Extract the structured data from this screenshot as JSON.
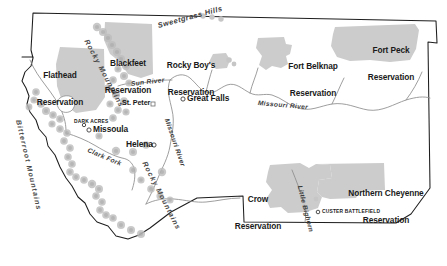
{
  "map": {
    "title": "Montana Indian Reservations and Physical Features",
    "region": "Montana",
    "background_color": "#ffffff",
    "reservation_fill": "#cccccc",
    "outline_color": "#1d1d1d",
    "river_color": "#8d8d8d",
    "mountain_symbol_color": "#bdbdbd"
  },
  "reservations": [
    {
      "id": "flathead",
      "name": "Flathead\nReservation",
      "line1": "Flathead",
      "line2": "Reservation",
      "x": 44,
      "y": 56
    },
    {
      "id": "blackfeet",
      "name": "Blackfeet\nReservation",
      "line1": "Blackfeet",
      "line2": "Reservation",
      "x": 122,
      "y": 44
    },
    {
      "id": "rocky-boys",
      "name": "Rocky Boy's\nReservation",
      "line1": "Rocky Boy's",
      "line2": "Reservation",
      "x": 186,
      "y": 46
    },
    {
      "id": "fort-belknap",
      "name": "Fort Belknap\nReservation",
      "line1": "Fort Belknap",
      "line2": "Reservation",
      "x": 272,
      "y": 48
    },
    {
      "id": "fort-peck",
      "name": "Fort Peck\nReservation",
      "line1": "Fort Peck",
      "line2": "Reservation",
      "x": 364,
      "y": 32
    },
    {
      "id": "crow",
      "name": "Crow\nReservation",
      "line1": "Crow",
      "line2": "Reservation",
      "x": 243,
      "y": 180
    },
    {
      "id": "northern-cheyenne",
      "name": "Northern Cheyenne\nReservation",
      "line1": "Northern Cheyenne",
      "line2": "Reservation",
      "x": 348,
      "y": 173
    }
  ],
  "cities": [
    {
      "id": "great-falls",
      "label": "Great Falls",
      "x": 186,
      "y": 96,
      "marker": "ring"
    },
    {
      "id": "missoula",
      "label": "Missoula",
      "x": 94,
      "y": 128,
      "marker": "ring"
    },
    {
      "id": "helena",
      "label": "Helena",
      "x": 128,
      "y": 142,
      "marker": "ring"
    },
    {
      "id": "st-peter",
      "label": "St. Peter",
      "x": 126,
      "y": 104,
      "marker": "square"
    },
    {
      "id": "dark-acres",
      "label": "DARK ACRES",
      "x": 84,
      "y": 121,
      "marker": "ring",
      "style": "caps"
    },
    {
      "id": "custer-battlefield",
      "label": "CUSTER BATTLEFIELD",
      "x": 321,
      "y": 211,
      "marker": "ring",
      "style": "caps"
    }
  ],
  "physical_features": [
    {
      "id": "sweetgrass-hills",
      "label": "Sweetgrass Hills",
      "type": "hills",
      "x": 166,
      "y": 18,
      "rotation": -14
    },
    {
      "id": "rocky-mountains-north",
      "label": "Rocky Mountains",
      "type": "range",
      "x": 90,
      "y": 40,
      "rotation": 63
    },
    {
      "id": "rocky-mountains-south",
      "label": "Rocky Mountains",
      "type": "range",
      "x": 146,
      "y": 160,
      "rotation": 64
    },
    {
      "id": "bitterroot-mountains",
      "label": "Bitterroot Mountains",
      "type": "range",
      "x": 16,
      "y": 118,
      "rotation": 78
    },
    {
      "id": "sun-river",
      "label": "Sun River",
      "type": "river",
      "x": 134,
      "y": 79,
      "rotation": -6
    },
    {
      "id": "missouri-river-east",
      "label": "Missouri River",
      "type": "river",
      "x": 262,
      "y": 101,
      "rotation": 4
    },
    {
      "id": "missouri-river-central",
      "label": "Missouri River",
      "type": "river",
      "x": 166,
      "y": 118,
      "rotation": 72
    },
    {
      "id": "clark-fork",
      "label": "Clark Fork",
      "type": "river",
      "x": 93,
      "y": 143,
      "rotation": 22
    },
    {
      "id": "little-bighorn",
      "label": "Little Bighorn",
      "type": "river",
      "x": 298,
      "y": 185,
      "rotation": 75
    }
  ]
}
